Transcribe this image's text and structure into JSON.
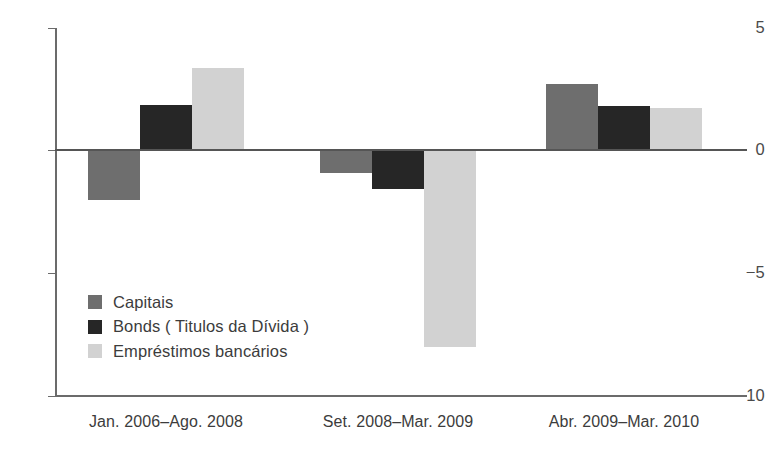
{
  "chart_data": {
    "type": "bar",
    "title": "",
    "subtitle": "",
    "xlabel": "",
    "ylabel": "",
    "ylim": [
      -10,
      5
    ],
    "yticks": [
      5,
      0,
      -5,
      -10
    ],
    "ytick_labels": [
      "5",
      "0",
      "−5",
      "−10"
    ],
    "grid": false,
    "legend_position": "inside-lower-left",
    "categories": [
      "Jan. 2006–Ago. 2008",
      "Set. 2008–Mar. 2009",
      "Abr. 2009–Mar. 2010"
    ],
    "series": [
      {
        "name": "Capitais",
        "color": "#6e6e6e",
        "values": [
          -2.0,
          -0.9,
          2.7
        ]
      },
      {
        "name": "Bonds ( Titulos da Dívida )",
        "color": "#262626",
        "values": [
          1.85,
          -1.55,
          1.8
        ]
      },
      {
        "name": "Empréstimos bancários",
        "color": "#d2d2d2",
        "values": [
          3.35,
          -8.0,
          1.7
        ]
      }
    ]
  },
  "axis": {
    "ticks": [
      {
        "label": "5",
        "value": 5
      },
      {
        "label": "0",
        "value": 0
      },
      {
        "label": "−5",
        "value": -5
      },
      {
        "label": "−10",
        "value": -10
      }
    ]
  },
  "legend": {
    "items": [
      {
        "label": "Capitais",
        "color": "#6e6e6e"
      },
      {
        "label": "Bonds ( Titulos da Dívida )",
        "color": "#262626"
      },
      {
        "label": "Empréstimos bancários",
        "color": "#d2d2d2"
      }
    ]
  },
  "colors": {
    "capitais": "#6e6e6e",
    "bonds": "#262626",
    "emprestimos": "#d2d2d2",
    "axis": "#6b6b6b",
    "zero_line": "#555555",
    "background": "#ffffff",
    "text": "#3c3c3c"
  }
}
